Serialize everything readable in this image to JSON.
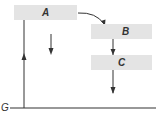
{
  "diagram": {
    "boxes": [
      {
        "id": "A",
        "label": "A"
      },
      {
        "id": "B",
        "label": "B"
      },
      {
        "id": "C",
        "label": "C"
      }
    ],
    "ground_label": "G",
    "colors": {
      "box": "#e4e4e4",
      "line": "#333333",
      "text": "#333333"
    }
  }
}
